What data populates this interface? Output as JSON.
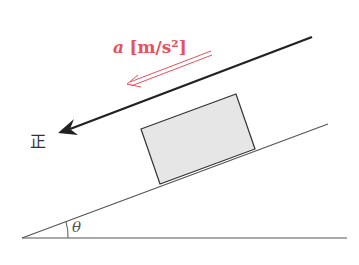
{
  "diagram": {
    "acceleration_label": {
      "symbol": "a",
      "unit": "[m/s²]"
    },
    "positive_direction_label": "正",
    "angle_label": "θ",
    "colors": {
      "acceleration": "#e8505b",
      "lines": "#555555",
      "arrow": "#222222",
      "block_fill": "#e6e6e6"
    }
  }
}
